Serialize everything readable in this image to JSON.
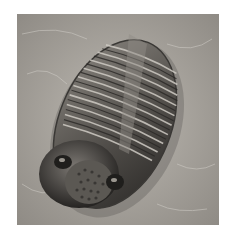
{
  "image": {
    "subject": "trilobite fossil",
    "alt": "Black-and-white photograph of a fossilized trilobite embedded in rock",
    "colors": {
      "background": "#ffffff",
      "rock": "#a9a59f",
      "rock_light": "#c9c6c0",
      "fossil_dark": "#2e2c2a",
      "fossil_mid": "#6b6863",
      "fossil_light": "#b5b1aa"
    }
  }
}
